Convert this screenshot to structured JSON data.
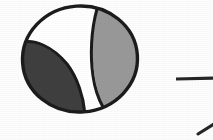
{
  "figure": {
    "name": "focal-mechanism-beachball",
    "type": "seismic-focal-mechanism",
    "background_color": "#fdfdfd",
    "outline_color": "#1c1c1c",
    "caption": "",
    "beachball": {
      "center_x": 80,
      "center_y": 59,
      "radius_x": 59,
      "radius_y": 54,
      "rotation_deg": -4,
      "outline_width": 3.4,
      "quadrants": [
        {
          "name": "compressional-lobe-left",
          "fill_color": "#3f3f3f",
          "shade": "dark-gray",
          "polarity": "compressional"
        },
        {
          "name": "compressional-lobe-right",
          "fill_color": "#999999",
          "shade": "light-gray",
          "polarity": "compressional"
        },
        {
          "name": "dilatational-region",
          "fill_color": "#ffffff",
          "shade": "white",
          "polarity": "dilatational"
        }
      ],
      "nodal_planes": [
        {
          "name": "nodal-plane-1",
          "stroke_color": "#1c1c1c",
          "stroke_width": 3.0
        },
        {
          "name": "nodal-plane-2",
          "stroke_color": "#1c1c1c",
          "stroke_width": 3.0
        }
      ]
    },
    "marks": [
      {
        "name": "horizontal-rule-segment",
        "kind": "line",
        "x1": 176,
        "y1": 79,
        "x2": 213,
        "y2": 78,
        "stroke_color": "#262626",
        "stroke_width": 3.2
      },
      {
        "name": "diagonal-tick-mark",
        "kind": "line",
        "x1": 199,
        "y1": 133,
        "x2": 213,
        "y2": 125,
        "stroke_color": "#262626",
        "stroke_width": 3.0
      }
    ]
  }
}
